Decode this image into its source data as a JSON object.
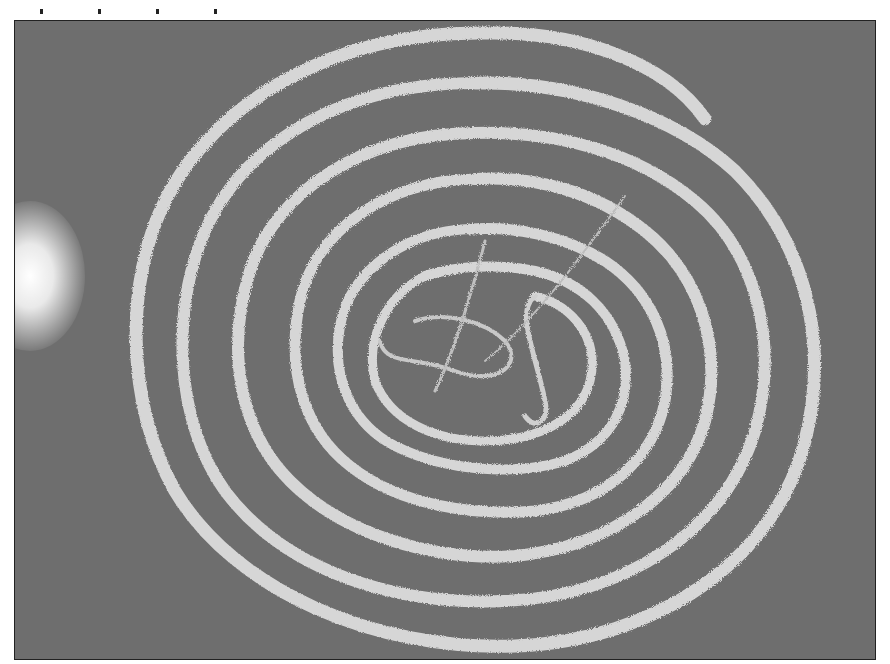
{
  "image": {
    "description": "Grayscale photograph of a long segmented worm (tapeworm) coiled in a spiral on a dark gray background",
    "subject": "tapeworm",
    "colors": {
      "background": "#6e6e6e",
      "worm": "#d8d8d8",
      "frame": "#222222",
      "page": "#ffffff"
    }
  }
}
